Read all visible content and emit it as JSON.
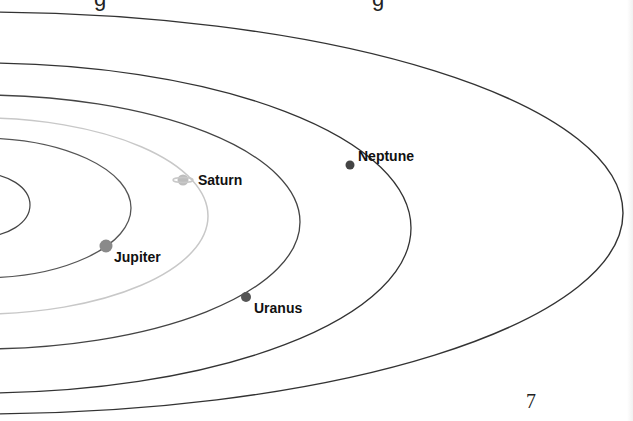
{
  "page": {
    "page_number": "7",
    "cut_heading_fragments": [
      "g",
      "g"
    ]
  },
  "colors": {
    "orbit": "#444444",
    "saturn_orbit": "#c8c8c8",
    "planet_dot": "#555555",
    "jupiter_dot": "#8a8a8a",
    "saturn_dot": "#bdbdbd",
    "label": "#111111"
  },
  "planets": [
    {
      "name": "Jupiter",
      "label": "Jupiter"
    },
    {
      "name": "Saturn",
      "label": "Saturn"
    },
    {
      "name": "Uranus",
      "label": "Uranus"
    },
    {
      "name": "Neptune",
      "label": "Neptune"
    }
  ],
  "orbits": [
    {
      "name": "inner-orbit",
      "cx": -20,
      "cy": 205,
      "rx": 50,
      "ry": 32
    },
    {
      "name": "jupiter-orbit",
      "cx": -20,
      "cy": 208,
      "rx": 151,
      "ry": 70
    },
    {
      "name": "saturn-orbit",
      "cx": -20,
      "cy": 216,
      "rx": 228,
      "ry": 98
    },
    {
      "name": "uranus-orbit",
      "cx": -20,
      "cy": 222,
      "rx": 320,
      "ry": 127
    },
    {
      "name": "neptune-orbit",
      "cx": -20,
      "cy": 228,
      "rx": 431,
      "ry": 165
    },
    {
      "name": "outer-orbit",
      "cx": -20,
      "cy": 213,
      "rx": 643,
      "ry": 201
    }
  ]
}
